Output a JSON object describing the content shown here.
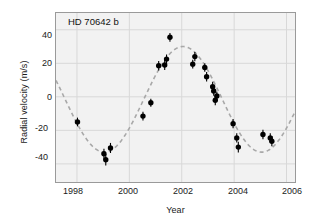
{
  "chart_data": {
    "type": "scatter",
    "title": "HD 70642 b",
    "xlabel": "Year",
    "ylabel": "Radial velocity (m/s)",
    "xlim": [
      1997.2,
      2006.4
    ],
    "ylim": [
      -52,
      50
    ],
    "xticks": [
      1998,
      2000,
      2002,
      2004,
      2006
    ],
    "xticklabels": [
      "1998",
      "2000",
      "2002",
      "2004",
      "2006"
    ],
    "yticks": [
      40,
      20,
      0,
      -20,
      -40
    ],
    "yticklabels": [
      "40",
      "20",
      "0",
      "-20",
      "-40"
    ],
    "grid": true,
    "legend": "none",
    "series": [
      {
        "name": "Radial velocity measurements",
        "marker": "filled-circle",
        "color": "#000000",
        "points": [
          {
            "x": 1998.02,
            "y": -15.0,
            "yerr": 2.6
          },
          {
            "x": 1999.03,
            "y": -34.0,
            "yerr": 3.0
          },
          {
            "x": 1999.1,
            "y": -37.5,
            "yerr": 3.4
          },
          {
            "x": 1999.28,
            "y": -30.5,
            "yerr": 3.0
          },
          {
            "x": 2000.52,
            "y": -11.5,
            "yerr": 2.6
          },
          {
            "x": 2000.82,
            "y": -3.5,
            "yerr": 2.4
          },
          {
            "x": 2001.12,
            "y": 18.5,
            "yerr": 2.8
          },
          {
            "x": 2001.35,
            "y": 19.0,
            "yerr": 3.0
          },
          {
            "x": 2001.42,
            "y": 22.5,
            "yerr": 2.8
          },
          {
            "x": 2001.55,
            "y": 35.5,
            "yerr": 2.6
          },
          {
            "x": 2002.42,
            "y": 19.5,
            "yerr": 2.6
          },
          {
            "x": 2002.5,
            "y": 24.0,
            "yerr": 2.8
          },
          {
            "x": 2002.88,
            "y": 17.5,
            "yerr": 2.6
          },
          {
            "x": 2002.95,
            "y": 12.0,
            "yerr": 2.8
          },
          {
            "x": 2003.18,
            "y": 6.0,
            "yerr": 3.0
          },
          {
            "x": 2003.22,
            "y": 3.5,
            "yerr": 2.8
          },
          {
            "x": 2003.28,
            "y": -2.0,
            "yerr": 3.0
          },
          {
            "x": 2003.34,
            "y": 0.5,
            "yerr": 2.6
          },
          {
            "x": 2003.96,
            "y": -16.0,
            "yerr": 2.8
          },
          {
            "x": 2004.1,
            "y": -24.5,
            "yerr": 2.8
          },
          {
            "x": 2004.16,
            "y": -30.0,
            "yerr": 3.2
          },
          {
            "x": 2005.1,
            "y": -22.5,
            "yerr": 2.8
          },
          {
            "x": 2005.38,
            "y": -24.5,
            "yerr": 2.8
          },
          {
            "x": 2005.44,
            "y": -26.5,
            "yerr": 3.0
          }
        ]
      },
      {
        "name": "Keplerian orbit fit",
        "style": "dashed",
        "color": "#a8a8a8",
        "fit": {
          "amplitude": 31.5,
          "offset": -1.5,
          "period_years": 6.0,
          "phase_peak_year": 2002.05
        }
      }
    ]
  }
}
